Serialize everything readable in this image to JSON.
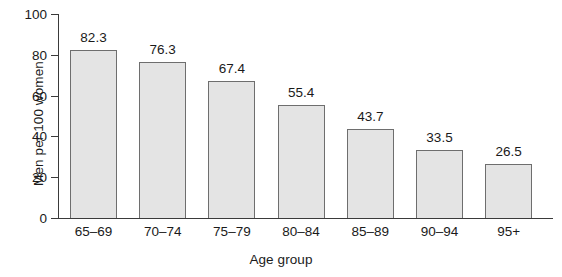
{
  "chart_data": {
    "type": "bar",
    "title": "",
    "xlabel": "Age group",
    "ylabel": "Men per 100 women",
    "categories": [
      "65–69",
      "70–74",
      "75–79",
      "80–84",
      "85–89",
      "90–94",
      "95+"
    ],
    "values": [
      82.3,
      76.3,
      67.4,
      55.4,
      43.7,
      33.5,
      26.5
    ],
    "value_labels": [
      "82.3",
      "76.3",
      "67.4",
      "55.4",
      "43.7",
      "33.5",
      "26.5"
    ],
    "ylim": [
      0,
      100
    ],
    "yticks": [
      0,
      20,
      40,
      60,
      80,
      100
    ],
    "ytick_labels": [
      "0",
      "20",
      "40",
      "60",
      "80",
      "100"
    ],
    "grid": false,
    "legend": null,
    "colors": {
      "bar_fill": "#e4e4e4",
      "bar_stroke": "#6e6e6e",
      "axis": "#3a3a3a",
      "text": "#1a1a1a",
      "background": "#ffffff"
    }
  }
}
